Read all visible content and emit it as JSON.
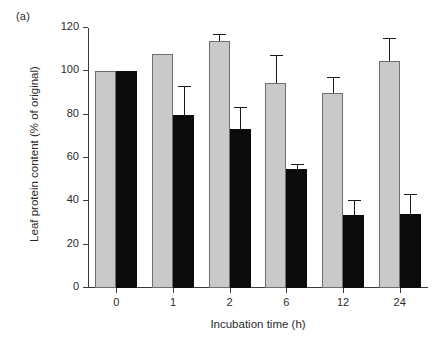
{
  "panel": {
    "label": "(a)"
  },
  "chart_data": {
    "type": "bar",
    "title": "",
    "subtitle": "",
    "xlabel": "Incubation time (h)",
    "ylabel": "Leaf protein content (% of original)",
    "categories": [
      "0",
      "1",
      "2",
      "6",
      "12",
      "24"
    ],
    "ylim": [
      0,
      120
    ],
    "yticks": [
      0,
      20,
      40,
      60,
      80,
      100,
      120
    ],
    "ytick_labels": [
      "0",
      "20",
      "40",
      "60",
      "80",
      "100",
      "120"
    ],
    "grid": false,
    "legend": "none",
    "legend_position": "none",
    "series": [
      {
        "name": "grey",
        "color": "#c9c9c9",
        "edge_color": "#6e6e6e",
        "values": [
          100,
          108,
          114,
          94.5,
          90,
          105
        ],
        "errors_upper": [
          0,
          0,
          3,
          12.5,
          7,
          10
        ],
        "errors_lower": [
          0,
          0,
          0,
          0,
          0,
          0
        ]
      },
      {
        "name": "black",
        "color": "#0b0b0b",
        "edge_color": "#0b0b0b",
        "values": [
          100,
          80,
          73.5,
          55,
          33.5,
          34
        ],
        "errors_upper": [
          0,
          13,
          9.5,
          2,
          6.5,
          9
        ],
        "errors_lower": [
          0,
          0,
          0,
          0,
          0,
          0
        ]
      }
    ]
  }
}
